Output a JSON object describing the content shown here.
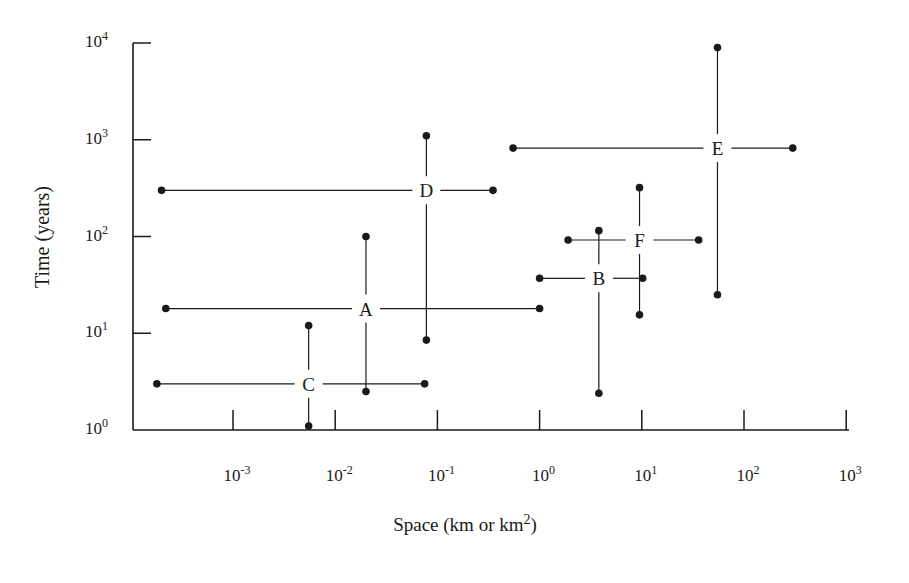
{
  "chart_data": {
    "type": "scatter",
    "title": "",
    "xlabel": "Space (km or km2)",
    "xlabel_base": "Space (km or km",
    "xlabel_sup": "2",
    "xlabel_tail": ")",
    "ylabel": "Time (years)",
    "xscale": "log",
    "yscale": "log",
    "xlim": [
      0.0001,
      1000
    ],
    "ylim": [
      1,
      10000
    ],
    "grid": false,
    "legend": null,
    "x_ticks": [
      {
        "base": "10",
        "exp": "-3",
        "value": 0.001
      },
      {
        "base": "10",
        "exp": "-2",
        "value": 0.01
      },
      {
        "base": "10",
        "exp": "-1",
        "value": 0.1
      },
      {
        "base": "10",
        "exp": "0",
        "value": 1
      },
      {
        "base": "10",
        "exp": "1",
        "value": 10
      },
      {
        "base": "10",
        "exp": "2",
        "value": 100
      },
      {
        "base": "10",
        "exp": "3",
        "value": 1000
      }
    ],
    "y_ticks": [
      {
        "base": "10",
        "exp": "0",
        "value": 1
      },
      {
        "base": "10",
        "exp": "1",
        "value": 10
      },
      {
        "base": "10",
        "exp": "2",
        "value": 100
      },
      {
        "base": "10",
        "exp": "3",
        "value": 1000
      },
      {
        "base": "10",
        "exp": "4",
        "value": 10000
      }
    ],
    "series": [
      {
        "name": "A",
        "center": {
          "x": 0.02,
          "y": 18
        },
        "x_range": [
          0.00022,
          1.0
        ],
        "y_range": [
          2.5,
          100
        ]
      },
      {
        "name": "B",
        "center": {
          "x": 3.8,
          "y": 37
        },
        "x_range": [
          1.0,
          10.2
        ],
        "y_range": [
          2.4,
          115
        ]
      },
      {
        "name": "C",
        "center": {
          "x": 0.0055,
          "y": 3.0
        },
        "x_range": [
          0.00018,
          0.075
        ],
        "y_range": [
          1.1,
          12
        ]
      },
      {
        "name": "D",
        "center": {
          "x": 0.078,
          "y": 300
        },
        "x_range": [
          0.0002,
          0.35
        ],
        "y_range": [
          8.5,
          1100
        ]
      },
      {
        "name": "E",
        "center": {
          "x": 55,
          "y": 820
        },
        "x_range": [
          0.55,
          300
        ],
        "y_range": [
          25,
          9000
        ]
      },
      {
        "name": "F",
        "center": {
          "x": 9.5,
          "y": 92
        },
        "x_range": [
          1.9,
          36
        ],
        "y_range": [
          15.5,
          320
        ]
      }
    ]
  },
  "axis_labels": {
    "y": "Time (years)",
    "x_main": "Space (km or km",
    "x_sup": "2",
    "x_tail": ")"
  }
}
